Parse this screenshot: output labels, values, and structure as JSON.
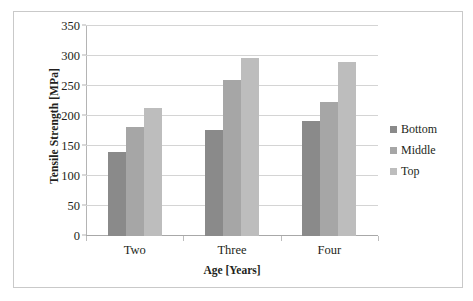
{
  "chart_data": {
    "type": "bar",
    "title": "",
    "xlabel": "Age [Years]",
    "ylabel": "Tensile Strength [MPa]",
    "categories": [
      "Two",
      "Three",
      "Four"
    ],
    "series": [
      {
        "name": "Bottom",
        "values": [
          140,
          176,
          191
        ],
        "color": "#8a8a8a"
      },
      {
        "name": "Middle",
        "values": [
          182,
          260,
          223
        ],
        "color": "#a6a6a6"
      },
      {
        "name": "Top",
        "values": [
          214,
          297,
          290
        ],
        "color": "#bdbdbd"
      }
    ],
    "ylim": [
      0,
      350
    ],
    "yticks": [
      0,
      50,
      100,
      150,
      200,
      250,
      300,
      350
    ],
    "ytick_labels": [
      "0",
      "50",
      "100",
      "150",
      "200",
      "250",
      "300",
      "350"
    ],
    "grid": true,
    "legend_position": "right"
  },
  "figure": {
    "border_color": "#c9c9c9",
    "background": "#ffffff"
  }
}
